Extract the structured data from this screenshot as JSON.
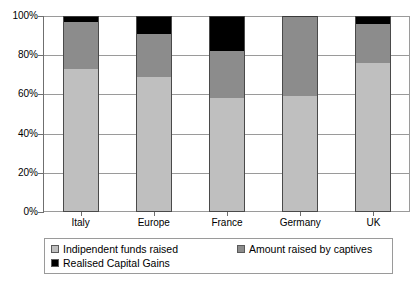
{
  "chart_data": {
    "type": "bar",
    "subtype": "stacked-percent",
    "title": "",
    "xlabel": "",
    "ylabel": "",
    "categories": [
      "Italy",
      "Europe",
      "France",
      "Germany",
      "UK"
    ],
    "series": [
      {
        "name": "Indipendent funds raised",
        "color": "#bfbfbf",
        "values": [
          73,
          69,
          58,
          59,
          76
        ]
      },
      {
        "name": "Amount raised by captives",
        "color": "#8c8c8c",
        "values": [
          24,
          22,
          24,
          41,
          20
        ]
      },
      {
        "name": "Realised Capital Gains",
        "color": "#000000",
        "values": [
          3,
          9,
          18,
          0,
          4
        ]
      }
    ],
    "ylim": [
      0,
      100
    ],
    "yticks": [
      0,
      20,
      40,
      60,
      80,
      100
    ],
    "ytick_labels": [
      "0%",
      "20%",
      "40%",
      "60%",
      "80%",
      "100%"
    ],
    "grid": true,
    "legend_position": "bottom"
  },
  "axis": {
    "y_labels": [
      "100%",
      "80%",
      "60%",
      "40%",
      "20%",
      "0%"
    ]
  },
  "legend": {
    "items": [
      {
        "label": "Indipendent funds raised",
        "color": "#bfbfbf"
      },
      {
        "label": "Amount raised by captives",
        "color": "#8c8c8c"
      },
      {
        "label": "Realised Capital Gains",
        "color": "#000000"
      }
    ]
  }
}
